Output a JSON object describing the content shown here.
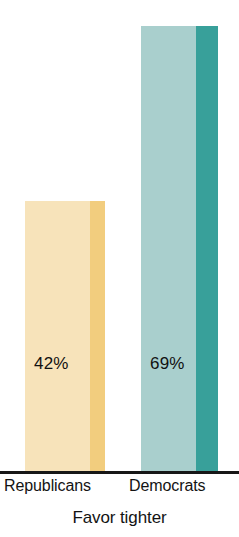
{
  "chart_data": {
    "type": "bar",
    "title": "",
    "subtitle": "",
    "caption": "Favor tighter",
    "xlabel": "",
    "ylabel": "",
    "grid": false,
    "legend": "none",
    "ylim": [
      0,
      73
    ],
    "categories": [
      "Republicans",
      "Democrats"
    ],
    "values": [
      42,
      69
    ],
    "value_labels": [
      "42%",
      "69%"
    ],
    "series": [
      {
        "name": "Favor tighter",
        "values": [
          42,
          69
        ]
      }
    ],
    "bars": [
      {
        "category": "Republicans",
        "value": 42,
        "value_label": "42%",
        "face_color": "#f7e3ba",
        "side_color": "#f2cd7e"
      },
      {
        "category": "Democrats",
        "value": 69,
        "value_label": "69%",
        "face_color": "#a9cfcd",
        "side_color": "#38a09a"
      }
    ],
    "axis_color": "#171717",
    "background_color": "#ffffff"
  }
}
